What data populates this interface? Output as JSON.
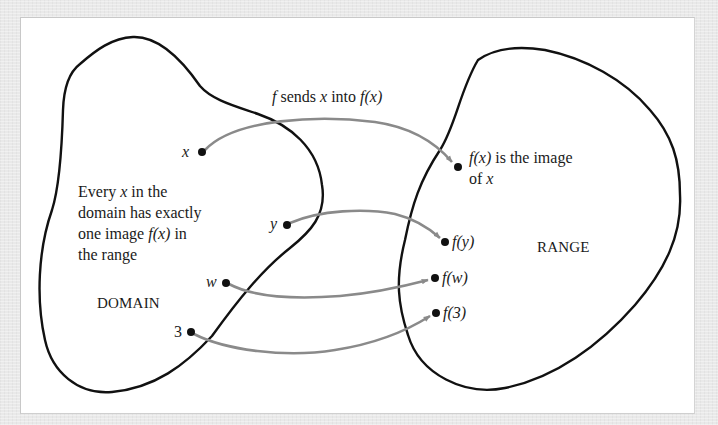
{
  "diagram": {
    "type": "function-mapping",
    "colors": {
      "background": "#e9e9e9",
      "panel": "#ffffff",
      "outline": "#111111",
      "arrow": "#8a8a8a",
      "dot": "#111111",
      "text": "#1a1a1a"
    },
    "sets": {
      "domain": {
        "label": "DOMAIN"
      },
      "range": {
        "label": "RANGE"
      }
    },
    "annotations": {
      "mapping_caption": {
        "f": "f",
        "text1": " sends ",
        "x": "x",
        "text2": " into ",
        "fx": "f(x)"
      },
      "domain_note": {
        "line1_a": "Every ",
        "line1_x": "x",
        "line1_b": " in the",
        "line2": "domain has exactly",
        "line3_a": "one image ",
        "line3_fx": "f(x)",
        "line3_b": " in",
        "line4": "the range"
      },
      "image_note": {
        "line1_fx": "f(x)",
        "line1_b": " is the image",
        "line2_a": "of ",
        "line2_x": "x"
      }
    },
    "domain_points": [
      {
        "id": "x",
        "label": "x"
      },
      {
        "id": "y",
        "label": "y"
      },
      {
        "id": "w",
        "label": "w"
      },
      {
        "id": "3",
        "label": "3"
      }
    ],
    "range_points": [
      {
        "id": "fx",
        "label": "f(x)"
      },
      {
        "id": "fy",
        "label": "f(y)"
      },
      {
        "id": "fw",
        "label": "f(w)"
      },
      {
        "id": "f3",
        "label": "f(3)"
      }
    ],
    "mappings": [
      {
        "from": "x",
        "to": "f(x)"
      },
      {
        "from": "y",
        "to": "f(y)"
      },
      {
        "from": "w",
        "to": "f(w)"
      },
      {
        "from": "3",
        "to": "f(3)"
      }
    ]
  }
}
